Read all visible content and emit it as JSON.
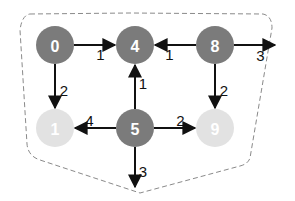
{
  "diagram": {
    "type": "directed-weighted-graph",
    "region": {
      "style": "dashed",
      "color": "#888888"
    },
    "colors": {
      "active_node": "#7b7b7b",
      "inactive_node": "#e2e2e2",
      "edge": "#111111",
      "node_text": "#ffffff"
    },
    "nodes": [
      {
        "id": "0",
        "label": "0",
        "x": 55,
        "y": 45,
        "state": "active"
      },
      {
        "id": "4",
        "label": "4",
        "x": 135,
        "y": 45,
        "state": "active"
      },
      {
        "id": "8",
        "label": "8",
        "x": 215,
        "y": 45,
        "state": "active"
      },
      {
        "id": "1",
        "label": "1",
        "x": 55,
        "y": 128,
        "state": "inactive"
      },
      {
        "id": "5",
        "label": "5",
        "x": 135,
        "y": 128,
        "state": "active"
      },
      {
        "id": "9",
        "label": "9",
        "x": 215,
        "y": 128,
        "state": "inactive"
      }
    ],
    "edges": [
      {
        "from": "0",
        "to": "4",
        "weight": "1"
      },
      {
        "from": "0",
        "to": "1",
        "weight": "2"
      },
      {
        "from": "8",
        "to": "4",
        "weight": "1"
      },
      {
        "from": "8",
        "to": "out-right",
        "weight": "3"
      },
      {
        "from": "8",
        "to": "9",
        "weight": "2"
      },
      {
        "from": "5",
        "to": "4",
        "weight": "1"
      },
      {
        "from": "5",
        "to": "1",
        "weight": "4"
      },
      {
        "from": "5",
        "to": "9",
        "weight": "2"
      },
      {
        "from": "5",
        "to": "out-down",
        "weight": "3"
      }
    ]
  }
}
